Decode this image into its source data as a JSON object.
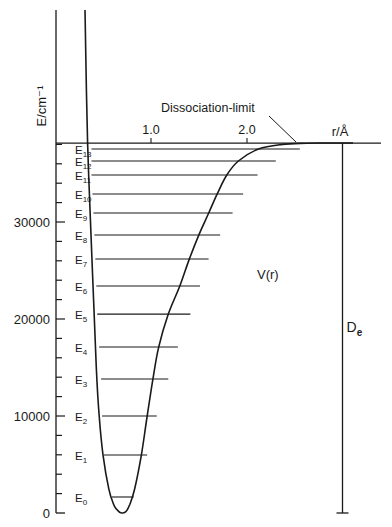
{
  "chart_data": {
    "type": "line",
    "title": "",
    "diagram": "Potential energy curve of a diatomic molecule with vibrational levels",
    "xlabel": "r/Å",
    "ylabel": "E/cm⁻¹",
    "x_ticks": [
      {
        "value": 1.0,
        "label": "1.0"
      },
      {
        "value": 2.0,
        "label": "2.0"
      }
    ],
    "y_ticks": [
      {
        "value": 0,
        "label": "0"
      },
      {
        "value": 10000,
        "label": "10000"
      },
      {
        "value": 20000,
        "label": "20000"
      },
      {
        "value": 30000,
        "label": "30000"
      }
    ],
    "y_minor_tick_step": 2000,
    "xlim": [
      0,
      3.4
    ],
    "ylim": [
      0,
      52000
    ],
    "curve_label": "V(r)",
    "curve_label_position": {
      "r": 2.0,
      "E": 24600
    },
    "dissociation_label": "Dissociation-limit",
    "dissociation_energy": 38140,
    "De_label": "D",
    "De_subscript": "e",
    "De_r": 3.0,
    "potential_curve": {
      "name": "V(r)",
      "r": [
        0.31,
        0.34,
        0.39,
        0.43,
        0.46,
        0.5,
        0.56,
        0.61,
        0.64,
        0.67,
        0.7,
        0.74,
        0.78,
        0.83,
        0.9,
        0.96,
        1.02,
        1.08,
        1.18,
        1.3,
        1.4,
        1.5,
        1.6,
        1.69,
        1.79,
        1.91,
        2.12,
        2.37,
        2.62,
        2.8
      ],
      "E": [
        52000,
        38140,
        25000,
        15000,
        10000,
        6000,
        2500,
        900,
        400,
        100,
        0,
        150,
        900,
        2500,
        6000,
        10000,
        13800,
        17100,
        20500,
        23400,
        26200,
        28700,
        30900,
        32900,
        34850,
        36290,
        37530,
        38000,
        38120,
        38140
      ]
    },
    "levels": [
      {
        "label": "E",
        "sub": "0",
        "E": 1650,
        "r_in": 0.59,
        "r_out": 0.82
      },
      {
        "label": "E",
        "sub": "1",
        "E": 5980,
        "r_in": 0.51,
        "r_out": 0.96
      },
      {
        "label": "E",
        "sub": "2",
        "E": 10000,
        "r_in": 0.49,
        "r_out": 1.06
      },
      {
        "label": "E",
        "sub": "3",
        "E": 13810,
        "r_in": 0.48,
        "r_out": 1.18
      },
      {
        "label": "E",
        "sub": "4",
        "E": 17110,
        "r_in": 0.46,
        "r_out": 1.28
      },
      {
        "label": "E",
        "sub": "5",
        "E": 20500,
        "r_in": 0.44,
        "r_out": 1.41
      },
      {
        "label": "E",
        "sub": "6",
        "E": 23400,
        "r_in": 0.43,
        "r_out": 1.51
      },
      {
        "label": "E",
        "sub": "7",
        "E": 26190,
        "r_in": 0.42,
        "r_out": 1.6
      },
      {
        "label": "E",
        "sub": "8",
        "E": 28660,
        "r_in": 0.41,
        "r_out": 1.72
      },
      {
        "label": "E",
        "sub": "9",
        "E": 30930,
        "r_in": 0.4,
        "r_out": 1.85
      },
      {
        "label": "E",
        "sub": "10",
        "E": 32890,
        "r_in": 0.39,
        "r_out": 1.96
      },
      {
        "label": "E",
        "sub": "11",
        "E": 34850,
        "r_in": 0.38,
        "r_out": 2.11
      },
      {
        "label": "E",
        "sub": "12",
        "E": 36290,
        "r_in": 0.38,
        "r_out": 2.3
      },
      {
        "label": "E",
        "sub": "13",
        "E": 37530,
        "r_in": 0.38,
        "r_out": 2.55
      }
    ]
  }
}
